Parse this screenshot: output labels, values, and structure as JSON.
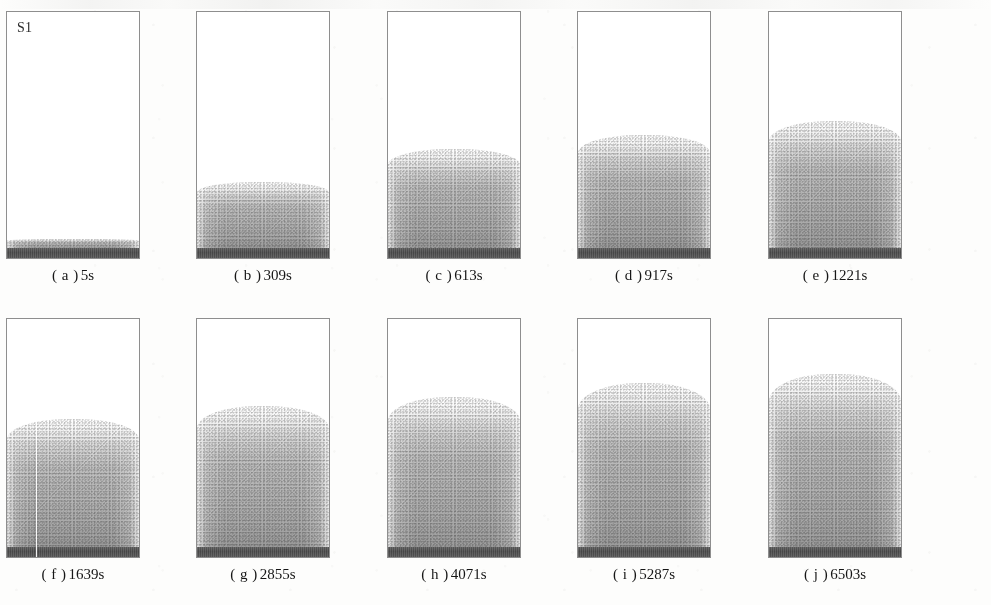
{
  "figure": {
    "series_label": "S1",
    "background_color": "#fdfdfc",
    "panel_border_color": "#8e8e8e",
    "bed_bar_color": "#4a4a4a",
    "plume_color_dense": "#9a9a9a",
    "plume_color_faint": "#ececec",
    "rows": 2,
    "columns": 5
  },
  "chart_data": {
    "type": "area",
    "title": "S1",
    "xlabel": "",
    "ylabel": "",
    "categories": [
      "5s",
      "309s",
      "613s",
      "917s",
      "1221s",
      "1639s",
      "2855s",
      "4071s",
      "5287s",
      "6503s"
    ],
    "values": [
      4,
      28,
      42,
      48,
      54,
      56,
      62,
      66,
      72,
      76
    ],
    "ylim": [
      0,
      100
    ],
    "series": [
      {
        "name": "plume height (% of panel height)",
        "values": [
          4,
          28,
          42,
          48,
          54,
          56,
          62,
          66,
          72,
          76
        ]
      },
      {
        "name": "elapsed time (s)",
        "values": [
          5,
          309,
          613,
          917,
          1221,
          1639,
          2855,
          4071,
          5287,
          6503
        ]
      }
    ],
    "legend_position": "none",
    "grid": false
  },
  "panels": [
    {
      "id": "a",
      "caption_paren": "( a )",
      "caption_time": "5s",
      "time_seconds": 5,
      "plume_height_pct": 4,
      "tag": "S1",
      "has_tag": true,
      "has_scan_streak": false
    },
    {
      "id": "b",
      "caption_paren": "( b )",
      "caption_time": "309s",
      "time_seconds": 309,
      "plume_height_pct": 28,
      "tag": "",
      "has_tag": false,
      "has_scan_streak": false
    },
    {
      "id": "c",
      "caption_paren": "( c )",
      "caption_time": "613s",
      "time_seconds": 613,
      "plume_height_pct": 42,
      "tag": "",
      "has_tag": false,
      "has_scan_streak": false
    },
    {
      "id": "d",
      "caption_paren": "( d )",
      "caption_time": "917s",
      "time_seconds": 917,
      "plume_height_pct": 48,
      "tag": "",
      "has_tag": false,
      "has_scan_streak": false
    },
    {
      "id": "e",
      "caption_paren": "( e )",
      "caption_time": "1221s",
      "time_seconds": 1221,
      "plume_height_pct": 54,
      "tag": "",
      "has_tag": false,
      "has_scan_streak": false
    },
    {
      "id": "f",
      "caption_paren": "( f )",
      "caption_time": "1639s",
      "time_seconds": 1639,
      "plume_height_pct": 56,
      "tag": "",
      "has_tag": false,
      "has_scan_streak": true
    },
    {
      "id": "g",
      "caption_paren": "( g )",
      "caption_time": "2855s",
      "time_seconds": 2855,
      "plume_height_pct": 62,
      "tag": "",
      "has_tag": false,
      "has_scan_streak": false
    },
    {
      "id": "h",
      "caption_paren": "( h )",
      "caption_time": "4071s",
      "time_seconds": 4071,
      "plume_height_pct": 66,
      "tag": "",
      "has_tag": false,
      "has_scan_streak": false
    },
    {
      "id": "i",
      "caption_paren": "( i )",
      "caption_time": "5287s",
      "time_seconds": 5287,
      "plume_height_pct": 72,
      "tag": "",
      "has_tag": false,
      "has_scan_streak": false
    },
    {
      "id": "j",
      "caption_paren": "( j )",
      "caption_time": "6503s",
      "time_seconds": 6503,
      "plume_height_pct": 76,
      "tag": "",
      "has_tag": false,
      "has_scan_streak": false
    }
  ]
}
